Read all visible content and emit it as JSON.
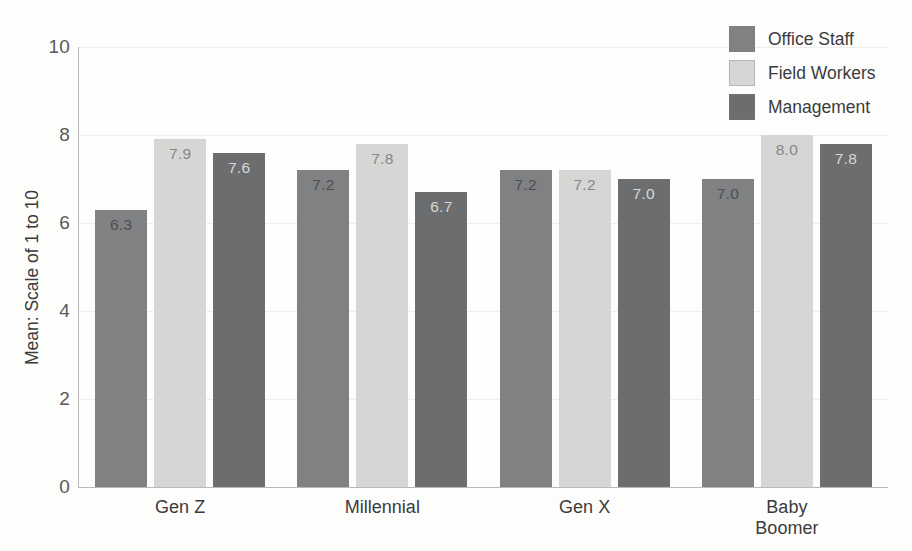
{
  "chart_data": {
    "type": "bar",
    "title": "",
    "subtitle": "",
    "xlabel": "",
    "ylabel": "Mean: Scale of 1 to 10",
    "categories": [
      "Gen Z",
      "Millennial",
      "Gen X",
      "Baby Boomer"
    ],
    "category_lines": [
      [
        "Gen Z"
      ],
      [
        "Millennial"
      ],
      [
        "Gen X"
      ],
      [
        "Baby",
        "Boomer"
      ]
    ],
    "series": [
      {
        "name": "Office Staff",
        "color": "#808183",
        "values": [
          6.3,
          7.2,
          7.2,
          7.0
        ]
      },
      {
        "name": "Field Workers",
        "color": "#d6d6d4",
        "values": [
          7.9,
          7.8,
          7.2,
          8.0
        ]
      },
      {
        "name": "Management",
        "color": "#6c6d6f",
        "values": [
          7.6,
          6.7,
          7.0,
          7.8
        ]
      }
    ],
    "value_labels": [
      [
        "6.3",
        "7.9",
        "7.6"
      ],
      [
        "7.2",
        "7.8",
        "6.7"
      ],
      [
        "7.2",
        "7.2",
        "7.0"
      ],
      [
        "7.0",
        "8.0",
        "7.8"
      ]
    ],
    "ylim": [
      0,
      10
    ],
    "yticks": [
      "0",
      "2",
      "4",
      "6",
      "8",
      "10"
    ],
    "ytick_values": [
      0,
      2,
      4,
      6,
      8,
      10
    ],
    "grid": true,
    "legend_position": "top-right",
    "legend": [
      "Office Staff",
      "Field Workers",
      "Management"
    ]
  },
  "colors": {
    "office_staff": "#808183",
    "field_workers": "#d6d6d4",
    "management": "#6c6d6f",
    "axis": "#b9b9b9",
    "grid": "#f0eeec",
    "text": "#3b3b3d",
    "tick_text": "#58595b",
    "background": "#fdfdfc"
  }
}
